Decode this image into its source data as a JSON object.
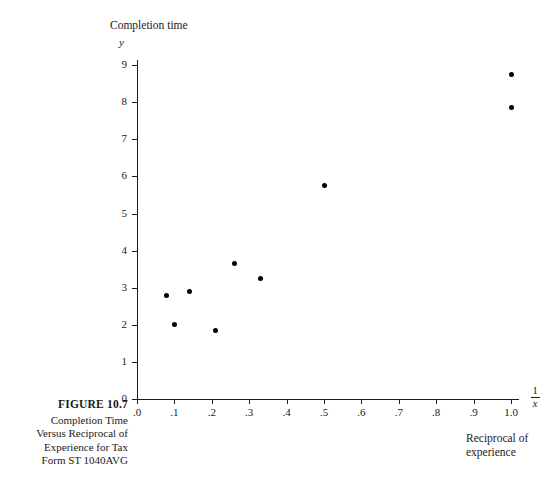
{
  "figure": {
    "number": "FIGURE  10.7",
    "caption_lines": [
      "Completion Time",
      "Versus Reciprocal of",
      "Experience for Tax",
      "Form ST 1040AVG"
    ]
  },
  "axis_titles": {
    "y_title": "Completion time",
    "y_variable": "y",
    "x_fraction_numerator": "1",
    "x_fraction_denominator": "x",
    "x_title_line1": "Reciprocal of",
    "x_title_line2": "experience"
  },
  "chart_data": {
    "type": "scatter",
    "title": "Completion Time Versus Reciprocal of Experience for Tax Form ST 1040AVG",
    "xlabel": "1/x  (Reciprocal of experience)",
    "ylabel": "y  (Completion time)",
    "xlim": [
      0.0,
      1.05
    ],
    "ylim": [
      0,
      9.3
    ],
    "grid": false,
    "legend": null,
    "x_tick_labels": [
      ".0",
      ".1",
      ".2",
      ".3",
      ".4",
      ".5",
      ".6",
      ".7",
      ".8",
      ".9",
      "1.0"
    ],
    "x_tick_values": [
      0.0,
      0.1,
      0.2,
      0.3,
      0.4,
      0.5,
      0.6,
      0.7,
      0.8,
      0.9,
      1.0
    ],
    "y_tick_labels": [
      "0",
      "1",
      "2",
      "3",
      "4",
      "5",
      "6",
      "7",
      "8",
      "9"
    ],
    "y_tick_values": [
      0,
      1,
      2,
      3,
      4,
      5,
      6,
      7,
      8,
      9
    ],
    "points": [
      {
        "x": 0.08,
        "y": 2.8
      },
      {
        "x": 0.1,
        "y": 2.0
      },
      {
        "x": 0.14,
        "y": 2.9
      },
      {
        "x": 0.21,
        "y": 1.85
      },
      {
        "x": 0.26,
        "y": 3.65
      },
      {
        "x": 0.33,
        "y": 3.25
      },
      {
        "x": 0.5,
        "y": 5.75
      },
      {
        "x": 1.0,
        "y": 7.85
      },
      {
        "x": 1.0,
        "y": 8.75
      }
    ]
  },
  "geometry": {
    "origin_x": 137,
    "origin_y": 399,
    "px_per_x_unit": 374,
    "px_per_y_unit": 37.1,
    "x_axis_end": 519,
    "y_axis_top": 60
  }
}
